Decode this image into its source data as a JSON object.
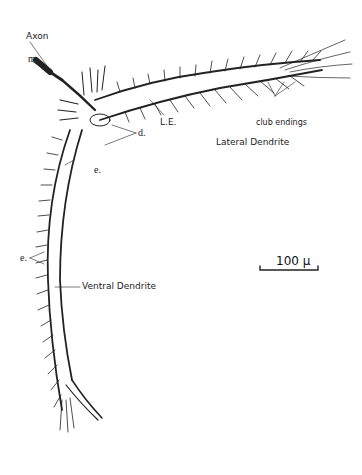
{
  "figure": {
    "type": "neuron-line-drawing",
    "labels": {
      "axon": "Axon",
      "m": "m.",
      "d": "d.",
      "le": "L.E.",
      "e_upper": "e.",
      "e_lower": "e.",
      "club_endings": "club endings",
      "lateral_dendrite": "Lateral Dendrite",
      "ventral_dendrite": "Ventral Dendrite"
    },
    "scale_bar": {
      "label": "100 μ"
    },
    "colors": {
      "ink": "#222222",
      "background": "#ffffff"
    }
  }
}
